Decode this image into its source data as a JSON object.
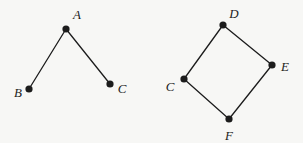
{
  "figure_title": "",
  "colors": {
    "background": "#f7f7f5",
    "ink": "#1c1c1c"
  },
  "style": {
    "dot_radius": 3.6,
    "edge_width": 1.3,
    "label_font_size": 13
  },
  "graphs": [
    {
      "name": "left-graph",
      "description": "path-graph-A-B-C",
      "vertices": [
        {
          "id": "A",
          "label": "A",
          "x": 66,
          "y": 29,
          "lx": 77,
          "ly": 14
        },
        {
          "id": "B",
          "label": "B",
          "x": 29,
          "y": 89,
          "lx": 18,
          "ly": 92
        },
        {
          "id": "C",
          "label": "C",
          "x": 110,
          "y": 84,
          "lx": 122,
          "ly": 88
        }
      ],
      "edges": [
        {
          "from": "A",
          "to": "B"
        },
        {
          "from": "A",
          "to": "C"
        }
      ]
    },
    {
      "name": "right-graph",
      "description": "cycle-graph-D-E-F-C",
      "vertices": [
        {
          "id": "D",
          "label": "D",
          "x": 223,
          "y": 25,
          "lx": 234,
          "ly": 13
        },
        {
          "id": "E",
          "label": "E",
          "x": 272,
          "y": 65,
          "lx": 285,
          "ly": 66
        },
        {
          "id": "C",
          "label": "C",
          "x": 184,
          "y": 79,
          "lx": 170,
          "ly": 86
        },
        {
          "id": "F",
          "label": "F",
          "x": 229,
          "y": 119,
          "lx": 229,
          "ly": 135
        }
      ],
      "edges": [
        {
          "from": "D",
          "to": "C"
        },
        {
          "from": "D",
          "to": "E"
        },
        {
          "from": "C",
          "to": "F"
        },
        {
          "from": "F",
          "to": "E"
        }
      ]
    }
  ]
}
